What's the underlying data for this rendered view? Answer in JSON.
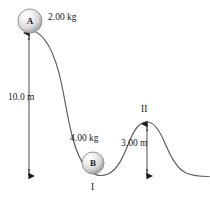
{
  "figure": {
    "background_color": "#ffffff",
    "track_color": "#555555",
    "arrow_color": "#1a1a1a",
    "ball_fill_light": "#ffffff",
    "ball_fill_mid": "#e2e2e2",
    "ball_fill_dark": "#9a9a9a",
    "ball_outline": "#8c8c8c"
  },
  "balls": [
    {
      "id": "A",
      "letter": "A",
      "mass_label": "2.00 kg",
      "cx": 30,
      "cy": 21,
      "r": 12
    },
    {
      "id": "B",
      "letter": "B",
      "mass_label": "4.00 kg",
      "cx": 93,
      "cy": 163,
      "r": 11
    }
  ],
  "measures": [
    {
      "id": "height-A",
      "label": "10.0 m",
      "value": 10.0,
      "unit": "m",
      "x": 29,
      "y_top": 32,
      "y_bottom": 177,
      "label_x": 8,
      "label_y": 93
    },
    {
      "id": "height-hill-II",
      "label": "3.00 m",
      "value": 3.0,
      "unit": "m",
      "x": 147,
      "y_top": 123,
      "y_bottom": 177,
      "label_x": 121,
      "label_y": 139
    }
  ],
  "mass_labels": [
    {
      "text": "2.00 kg",
      "x": 48,
      "y": 13
    },
    {
      "text": "4.00 kg",
      "x": 70,
      "y": 134
    }
  ],
  "point_labels": [
    {
      "text": "I",
      "x": 91,
      "y": 183
    },
    {
      "text": "II",
      "x": 142,
      "y": 106
    }
  ]
}
